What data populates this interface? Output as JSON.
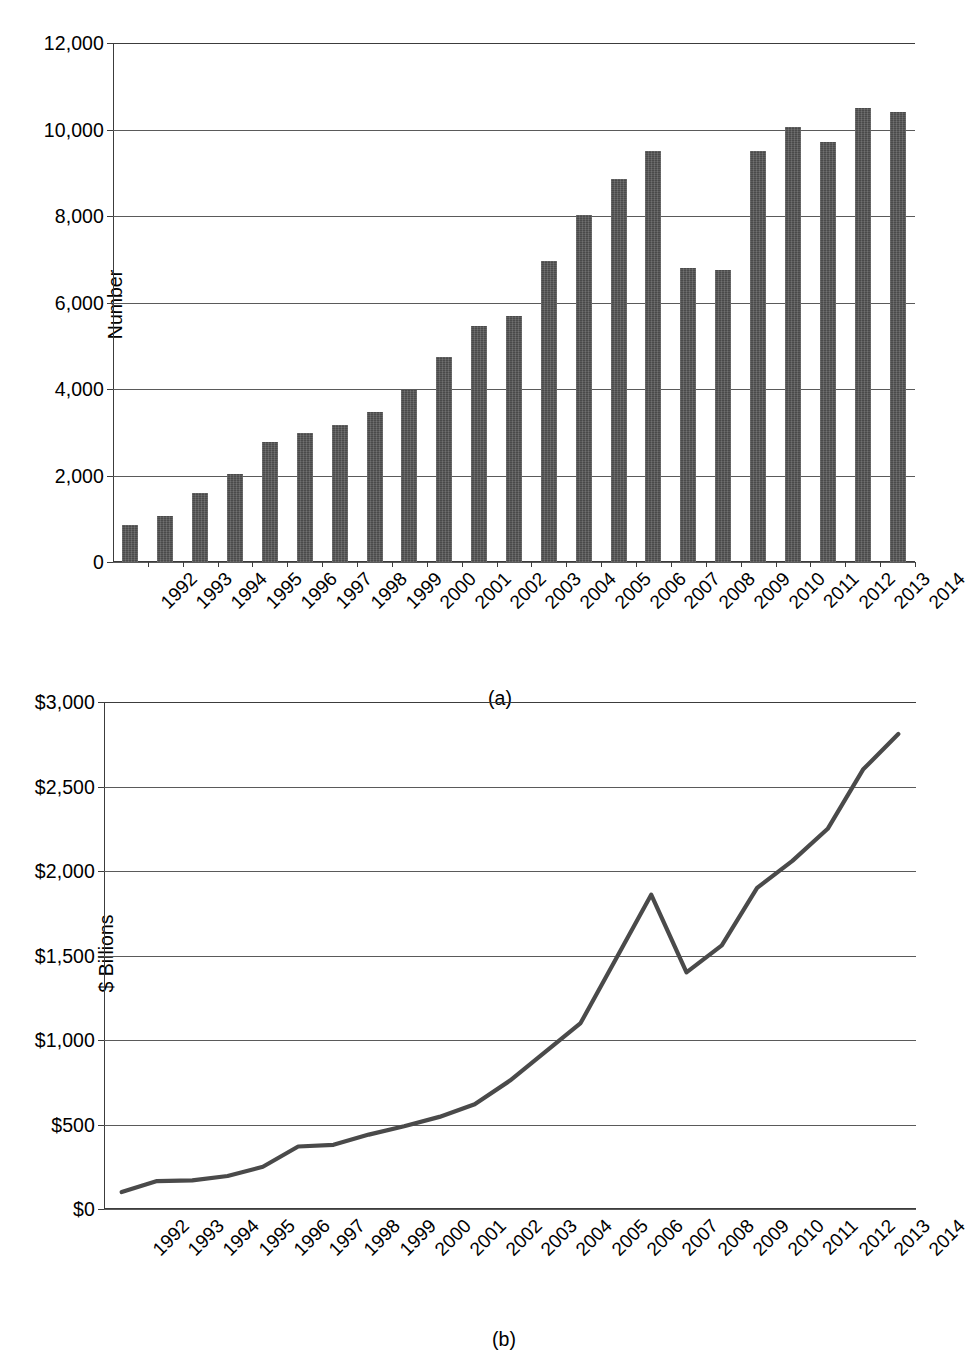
{
  "figure": {
    "panel_a_caption": "(a)",
    "panel_b_caption": "(b)"
  },
  "chart_data": [
    {
      "type": "bar",
      "panel": "(a)",
      "title": "",
      "xlabel": "",
      "ylabel": "Number",
      "ylim": [
        0,
        12000
      ],
      "yticks": [
        0,
        2000,
        4000,
        6000,
        8000,
        10000,
        12000
      ],
      "ytick_labels": [
        "0",
        "2,000",
        "4,000",
        "6,000",
        "8,000",
        "10,000",
        "12,000"
      ],
      "grid": true,
      "legend": "none",
      "bar_color": "#4a4a4a",
      "categories": [
        "1992",
        "1993",
        "1994",
        "1995",
        "1996",
        "1997",
        "1998",
        "1999",
        "2000",
        "2001",
        "2002",
        "2003",
        "2004",
        "2005",
        "2006",
        "2007",
        "2008",
        "2009",
        "2010",
        "2011",
        "2012",
        "2013",
        "2014"
      ],
      "values": [
        860,
        1060,
        1600,
        2030,
        2780,
        2990,
        3160,
        3480,
        3970,
        4750,
        5450,
        5680,
        6950,
        8020,
        8850,
        9500,
        6800,
        6750,
        9500,
        10050,
        9700,
        10500,
        10400
      ]
    },
    {
      "type": "line",
      "panel": "(b)",
      "title": "",
      "xlabel": "",
      "ylabel": "$ Billions",
      "ylim": [
        0,
        3000
      ],
      "yticks": [
        0,
        500,
        1000,
        1500,
        2000,
        2500,
        3000
      ],
      "ytick_labels": [
        "$0",
        "$500",
        "$1,000",
        "$1,500",
        "$2,000",
        "$2,500",
        "$3,000"
      ],
      "grid": true,
      "legend": "none",
      "line_color": "#4a4a4a",
      "categories": [
        "1992",
        "1993",
        "1994",
        "1995",
        "1996",
        "1997",
        "1998",
        "1999",
        "2000",
        "2001",
        "2002",
        "2003",
        "2004",
        "2005",
        "2006",
        "2007",
        "2008",
        "2009",
        "2010",
        "2011",
        "2012",
        "2013",
        "2014"
      ],
      "values": [
        100,
        165,
        170,
        195,
        250,
        370,
        380,
        440,
        490,
        545,
        620,
        760,
        930,
        1100,
        1480,
        1860,
        1400,
        1560,
        1900,
        2060,
        2250,
        2600,
        2810
      ]
    }
  ]
}
